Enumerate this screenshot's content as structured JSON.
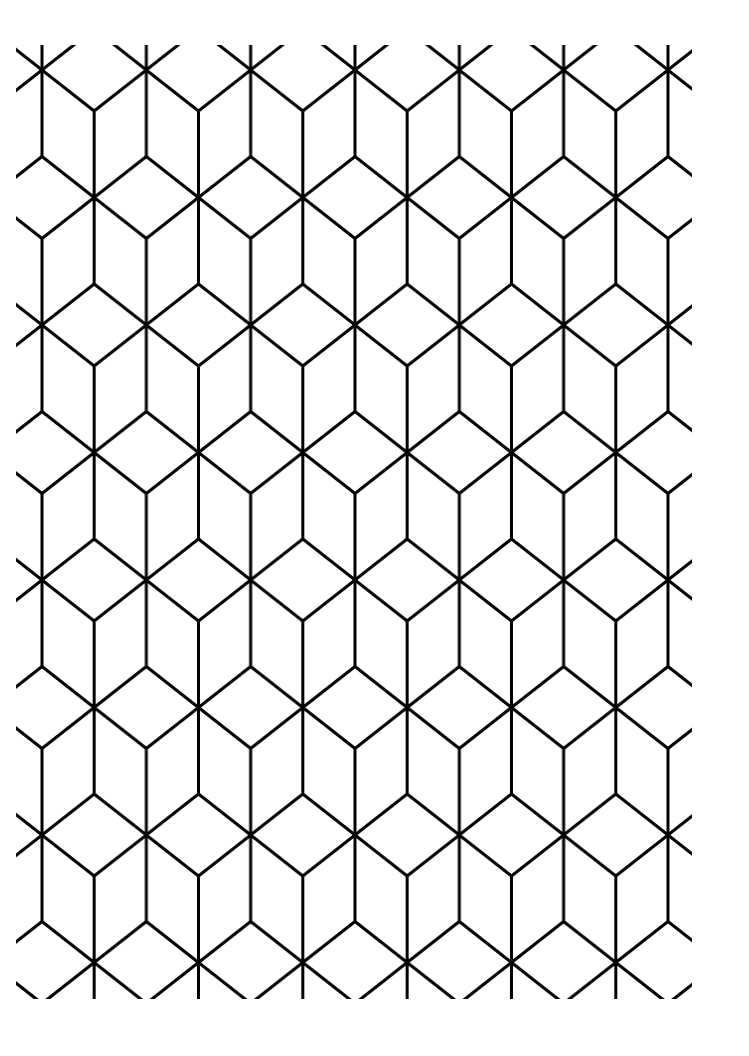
{
  "image": {
    "description": "Black-and-white isometric cube (tumbling blocks) line pattern",
    "background": "#ffffff",
    "line_color": "#000000",
    "line_width": 3,
    "clip": {
      "x": 16,
      "y": 45,
      "width": 676,
      "height": 954
    },
    "tile": {
      "origin_x": 42,
      "origin_y": 70,
      "width": 104.33,
      "height": 255,
      "vertex_offset": 41,
      "vertical_length": 85
    }
  }
}
